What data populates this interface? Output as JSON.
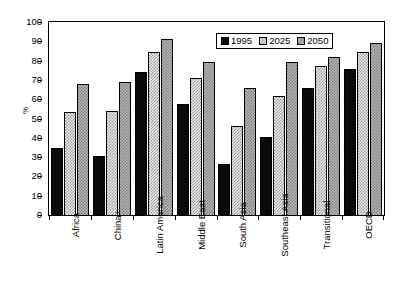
{
  "chart_data": {
    "type": "bar",
    "title": "",
    "xlabel": "",
    "ylabel": "%",
    "ylim": [
      0,
      100
    ],
    "ytick_step": 10,
    "yticks": [
      100,
      90,
      80,
      70,
      60,
      50,
      40,
      30,
      20,
      10,
      0
    ],
    "grid": false,
    "legend_position": "top-right",
    "categories": [
      "Africa",
      "China+",
      "Latin America",
      "Middle East",
      "South Asia",
      "Southeast Asia",
      "Transitional",
      "OECD"
    ],
    "series": [
      {
        "name": "1995",
        "pattern": "solid-black",
        "color": "#0a0a0a",
        "values": [
          34.5,
          30.5,
          74,
          57.5,
          26.5,
          40.5,
          66,
          75.5
        ]
      },
      {
        "name": "2025",
        "pattern": "light-checker",
        "color": "#e9e9e9",
        "values": [
          53.5,
          54,
          84.5,
          71,
          46,
          61.5,
          77,
          84.5
        ]
      },
      {
        "name": "2050",
        "pattern": "dark-checker",
        "color": "#b5b5b5",
        "values": [
          68,
          69,
          91,
          79.5,
          66,
          79.5,
          82,
          89
        ]
      }
    ]
  },
  "legend": {
    "items": [
      {
        "label": "1995"
      },
      {
        "label": "2025"
      },
      {
        "label": "2050"
      }
    ]
  },
  "axes": {
    "y_label": "%"
  }
}
